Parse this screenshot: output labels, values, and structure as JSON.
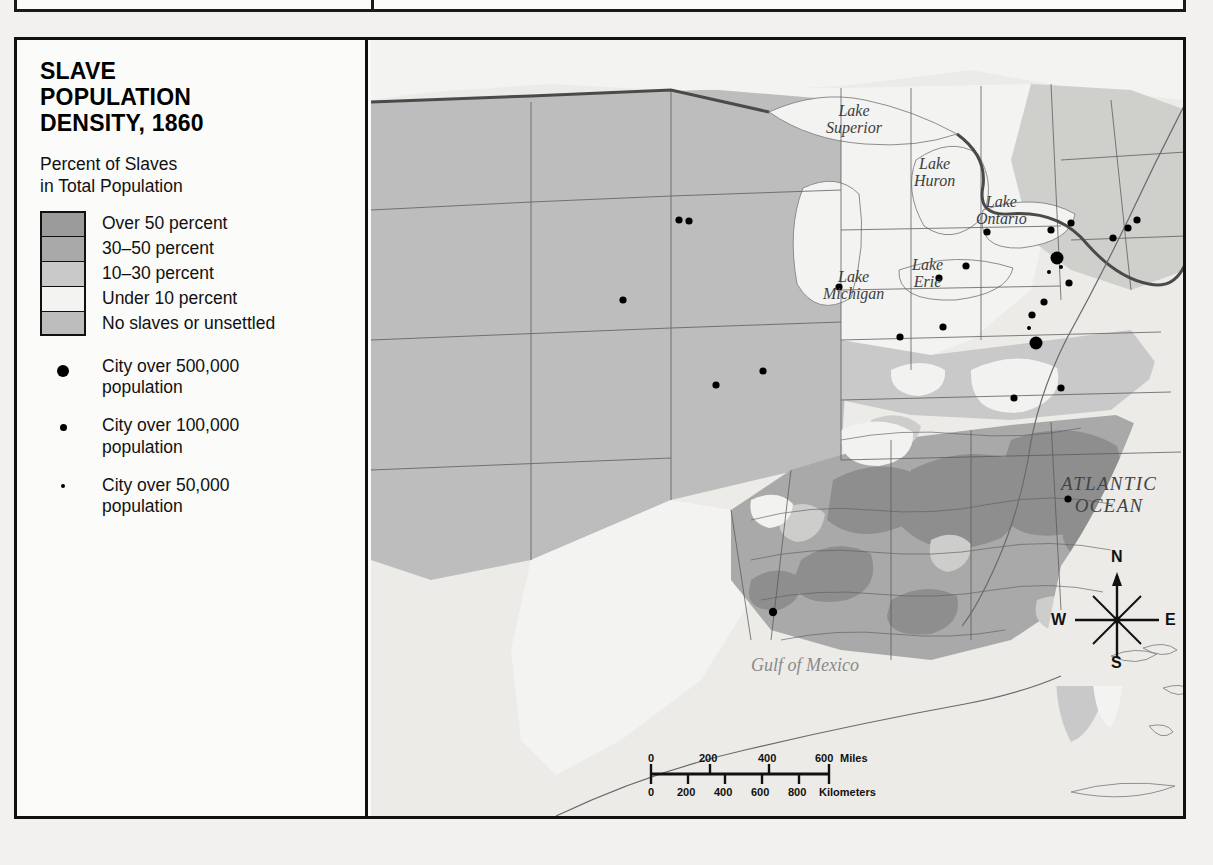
{
  "figure": {
    "title_lines": [
      "SLAVE",
      "POPULATION",
      "DENSITY, 1860"
    ],
    "subtitle_lines": [
      "Percent of Slaves",
      "in Total Population"
    ]
  },
  "legend": {
    "density_classes": [
      {
        "label": "Over 50 percent",
        "color": "#9b9b9b"
      },
      {
        "label": "30–50 percent",
        "color": "#a9a9a9"
      },
      {
        "label": "10–30 percent",
        "color": "#c9c9c9"
      },
      {
        "label": "Under 10 percent",
        "color": "#f3f3f1"
      },
      {
        "label": "No slaves or unsettled",
        "color": "#bdbdbd"
      }
    ],
    "city_classes": [
      {
        "icon": "large-dot-icon",
        "size": "lg",
        "line1": "City over 500,000",
        "line2": "population"
      },
      {
        "icon": "medium-dot-icon",
        "size": "md",
        "line1": "City over 100,000",
        "line2": "population"
      },
      {
        "icon": "small-dot-icon",
        "size": "sm",
        "line1": "City over 50,000",
        "line2": "population"
      }
    ]
  },
  "map": {
    "water_labels": [
      {
        "name": "lake-superior-label",
        "text_line1": "Lake",
        "text_line2": "Superior",
        "x": 455,
        "y": 62
      },
      {
        "name": "lake-huron-label",
        "text_line1": "Lake",
        "text_line2": "Huron",
        "x": 543,
        "y": 115
      },
      {
        "name": "lake-ontario-label",
        "text_line1": "Lake",
        "text_line2": "Ontario",
        "x": 605,
        "y": 153
      },
      {
        "name": "lake-erie-label",
        "text_line1": "Lake",
        "text_line2": "Erie",
        "x": 541,
        "y": 216
      },
      {
        "name": "lake-michigan-label",
        "text_line1": "Lake",
        "text_line2": "Michigan",
        "x": 452,
        "y": 228
      }
    ],
    "ocean_label": {
      "line1": "ATLANTIC",
      "line2": "OCEAN",
      "x": 690,
      "y": 433
    },
    "gulf_label": {
      "text": "Gulf of Mexico",
      "x": 380,
      "y": 615
    },
    "compass": {
      "north": "N",
      "south": "S",
      "east": "E",
      "west": "W"
    },
    "scale": {
      "miles_unit": "Miles",
      "kilometers_unit": "Kilometers",
      "miles_ticks": [
        "0",
        "200",
        "400",
        "600"
      ],
      "km_ticks": [
        "0",
        "200",
        "400",
        "600",
        "800"
      ]
    }
  },
  "chart_data": {
    "type": "map",
    "title": "SLAVE POPULATION DENSITY, 1860",
    "legend_title": "Percent of Slaves in Total Population",
    "classes": [
      {
        "label": "Over 50 percent",
        "color": "#9b9b9b"
      },
      {
        "label": "30–50 percent",
        "color": "#a9a9a9"
      },
      {
        "label": "10–30 percent",
        "color": "#c9c9c9"
      },
      {
        "label": "Under 10 percent",
        "color": "#f3f3f1"
      },
      {
        "label": "No slaves or unsettled",
        "color": "#bdbdbd"
      }
    ],
    "city_symbol_classes": [
      {
        "label": "City over 500,000 population",
        "marker_radius_px": 6
      },
      {
        "label": "City over 100,000 population",
        "marker_radius_px": 3.5
      },
      {
        "label": "City over 50,000 population",
        "marker_radius_px": 2
      }
    ],
    "scale_bar": {
      "miles": [
        0,
        200,
        400,
        600
      ],
      "kilometers": [
        0,
        200,
        400,
        600,
        800
      ]
    }
  }
}
